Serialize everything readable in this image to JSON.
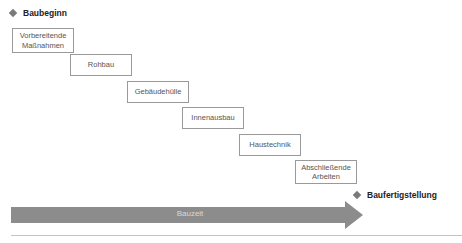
{
  "milestones": {
    "start": "Baubeginn",
    "end": "Baufertigstellung"
  },
  "phases": [
    {
      "label": "Vorbereitende Maßnahmen"
    },
    {
      "label": "Rohbau"
    },
    {
      "label": "Gebäudehülle"
    },
    {
      "label": "Innenausbau"
    },
    {
      "label": "Haustechnik"
    },
    {
      "label": "Abschließende Arbeiten"
    }
  ],
  "timeline": {
    "label": "Bauzeit"
  },
  "colors": {
    "arrow": "#8c8c8c",
    "diamond": "#7a7a7a",
    "box_border": "#9a9a9a",
    "baseline": "#c4c4c4"
  }
}
